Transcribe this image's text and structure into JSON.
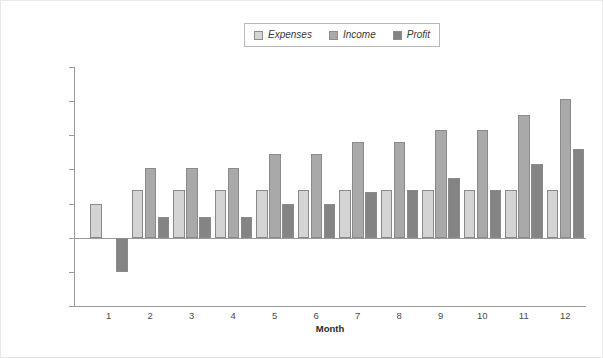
{
  "chart_data": {
    "type": "bar",
    "title": "",
    "xlabel": "Month",
    "ylabel": "",
    "categories": [
      "1",
      "2",
      "3",
      "4",
      "5",
      "6",
      "7",
      "8",
      "9",
      "10",
      "11",
      "12"
    ],
    "ylim": [
      -20000,
      50000
    ],
    "ytick_values": [
      50000,
      40000,
      30000,
      20000,
      10000,
      0,
      -10000,
      -20000
    ],
    "ytick_labels": [
      "$50,000",
      "$40,000",
      "$30,000",
      "$20,000",
      "$10,000",
      "$0",
      "-$10,000",
      "-$20,000"
    ],
    "grid": false,
    "legend_position": "top-center",
    "series": [
      {
        "name": "Expenses",
        "color": "#d4d4d4",
        "values": [
          10000,
          14000,
          14000,
          14000,
          14000,
          14000,
          14000,
          14000,
          14000,
          14000,
          14000,
          14000
        ]
      },
      {
        "name": "Income",
        "color": "#a9a9a9",
        "values": [
          0,
          20500,
          20500,
          20500,
          24500,
          24500,
          28000,
          28000,
          31500,
          31500,
          36000,
          40500
        ]
      },
      {
        "name": "Profit",
        "color": "#848484",
        "values": [
          -10000,
          6000,
          6000,
          6000,
          10000,
          10000,
          13500,
          14000,
          17500,
          14000,
          21500,
          26000
        ]
      }
    ]
  },
  "legend": {
    "items": [
      {
        "label": "Expenses",
        "swatch": "#d4d4d4"
      },
      {
        "label": "Income",
        "swatch": "#a9a9a9"
      },
      {
        "label": "Profit",
        "swatch": "#848484"
      }
    ]
  },
  "axis": {
    "x_title": "Month"
  }
}
